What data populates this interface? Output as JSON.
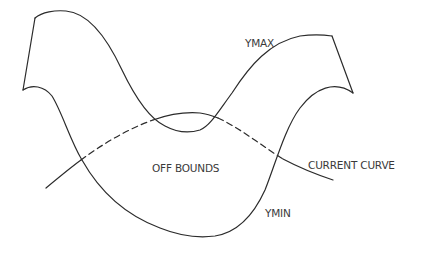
{
  "diagram": {
    "labels": {
      "ymax": "YMAX",
      "ymin": "YMIN",
      "off_bounds": "OFF BOUNDS",
      "current_curve": "CURRENT CURVE"
    },
    "line_color": "#2b2b2b",
    "text_color": "#3a3a3a",
    "curves": [
      {
        "name": "ymax",
        "style": "solid"
      },
      {
        "name": "ymin",
        "style": "solid"
      },
      {
        "name": "current-curve",
        "style": "solid where within bounds, dashed where off bounds"
      }
    ]
  }
}
